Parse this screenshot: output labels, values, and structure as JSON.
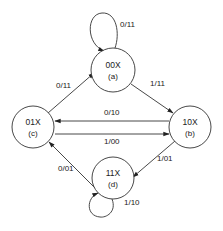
{
  "diagram": {
    "type": "state-machine",
    "colors": {
      "stroke": "#333333",
      "text": "#222222",
      "background": "#ffffff"
    },
    "states": [
      {
        "key": "a",
        "name": "00X",
        "id": "(a)"
      },
      {
        "key": "b",
        "name": "10X",
        "id": "(b)"
      },
      {
        "key": "c",
        "name": "01X",
        "id": "(c)"
      },
      {
        "key": "d",
        "name": "11X",
        "id": "(d)"
      }
    ],
    "transitions": [
      {
        "from": "a",
        "to": "a",
        "label": "0/11"
      },
      {
        "from": "c",
        "to": "a",
        "label": "0/11"
      },
      {
        "from": "a",
        "to": "b",
        "label": "1/11"
      },
      {
        "from": "b",
        "to": "c",
        "label": "0/10"
      },
      {
        "from": "c",
        "to": "b",
        "label": "1/00"
      },
      {
        "from": "b",
        "to": "d",
        "label": "1/01"
      },
      {
        "from": "d",
        "to": "c",
        "label": "0/01"
      },
      {
        "from": "d",
        "to": "d",
        "label": "1/10"
      }
    ]
  }
}
